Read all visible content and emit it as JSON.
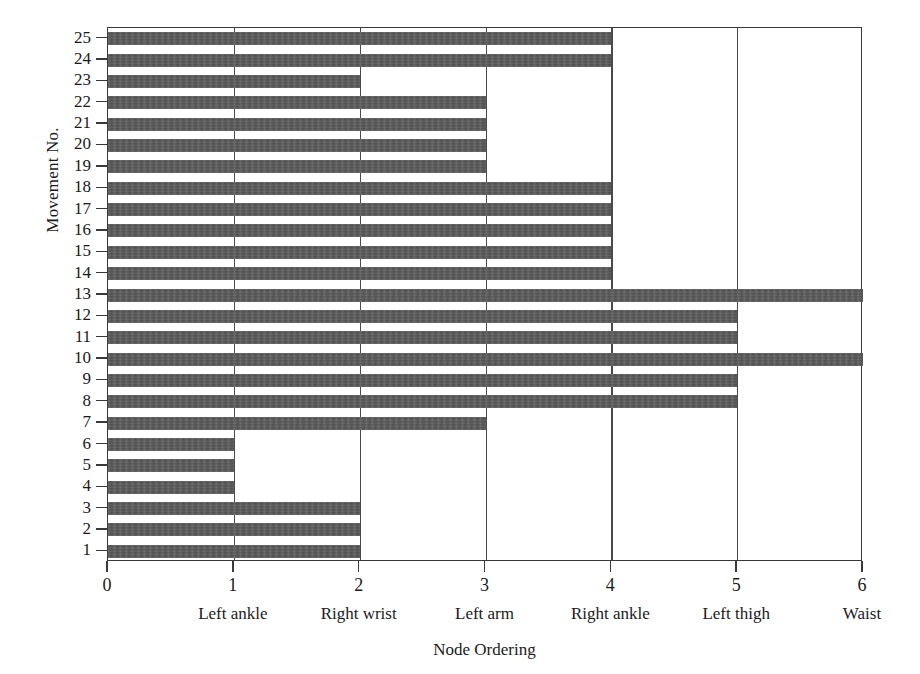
{
  "chart_data": {
    "type": "bar",
    "orientation": "horizontal",
    "title": "",
    "xlabel": "Node Ordering",
    "ylabel": "Movement No.",
    "xlim": [
      0,
      6
    ],
    "ylim": [
      0.5,
      25.5
    ],
    "grid": "vertical gridlines at each integer x tick",
    "legend": "none",
    "bar_color": "#585858",
    "axis_color": "#3a3a3a",
    "background_color": "#ffffff",
    "x_ticks": [
      0,
      1,
      2,
      3,
      4,
      5,
      6
    ],
    "x_tick_labels": [
      "0",
      "1",
      "2",
      "3",
      "4",
      "5",
      "6"
    ],
    "x_node_labels": [
      "",
      "Left ankle",
      "Right wrist",
      "Left arm",
      "Right ankle",
      "Left thigh",
      "Waist"
    ],
    "node_names": [
      "Left ankle",
      "Right wrist",
      "Left arm",
      "Right ankle",
      "Left thigh",
      "Waist"
    ],
    "categories": [
      1,
      2,
      3,
      4,
      5,
      6,
      7,
      8,
      9,
      10,
      11,
      12,
      13,
      14,
      15,
      16,
      17,
      18,
      19,
      20,
      21,
      22,
      23,
      24,
      25
    ],
    "y_tick_labels": [
      "1",
      "2",
      "3",
      "4",
      "5",
      "6",
      "7",
      "8",
      "9",
      "10",
      "11",
      "12",
      "13",
      "14",
      "15",
      "16",
      "17",
      "18",
      "19",
      "20",
      "21",
      "22",
      "23",
      "24",
      "25"
    ],
    "values": [
      2,
      2,
      2,
      1,
      1,
      1,
      3,
      5,
      5,
      6,
      5,
      5,
      6,
      4,
      4,
      4,
      4,
      4,
      3,
      3,
      3,
      3,
      2,
      4,
      4
    ],
    "bars": [
      {
        "movement": 1,
        "value": 2
      },
      {
        "movement": 2,
        "value": 2
      },
      {
        "movement": 3,
        "value": 2
      },
      {
        "movement": 4,
        "value": 1
      },
      {
        "movement": 5,
        "value": 1
      },
      {
        "movement": 6,
        "value": 1
      },
      {
        "movement": 7,
        "value": 3
      },
      {
        "movement": 8,
        "value": 5
      },
      {
        "movement": 9,
        "value": 5
      },
      {
        "movement": 10,
        "value": 6
      },
      {
        "movement": 11,
        "value": 5
      },
      {
        "movement": 12,
        "value": 5
      },
      {
        "movement": 13,
        "value": 6
      },
      {
        "movement": 14,
        "value": 4
      },
      {
        "movement": 15,
        "value": 4
      },
      {
        "movement": 16,
        "value": 4
      },
      {
        "movement": 17,
        "value": 4
      },
      {
        "movement": 18,
        "value": 4
      },
      {
        "movement": 19,
        "value": 3
      },
      {
        "movement": 20,
        "value": 3
      },
      {
        "movement": 21,
        "value": 3
      },
      {
        "movement": 22,
        "value": 3
      },
      {
        "movement": 23,
        "value": 2
      },
      {
        "movement": 24,
        "value": 4
      },
      {
        "movement": 25,
        "value": 4
      }
    ]
  }
}
